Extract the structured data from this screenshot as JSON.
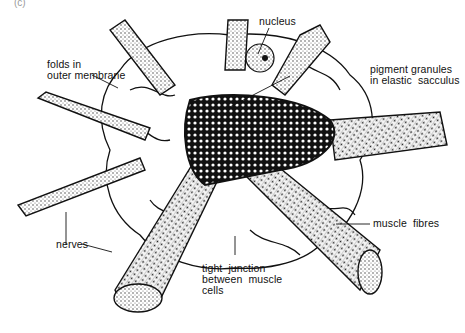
{
  "figure": {
    "panel_label": "(c)",
    "colors": {
      "ink": "#111111",
      "paper": "#ffffff",
      "stipple": "#555555"
    }
  },
  "labels": {
    "nucleus": "nucleus",
    "folds": "folds in\nouter membrane",
    "pigment": "pigment granules\nin elastic  sacculus",
    "nerves": "nerves",
    "junction": "tight  junction\nbetween  muscle\ncells",
    "muscle": "muscle  fibres"
  }
}
